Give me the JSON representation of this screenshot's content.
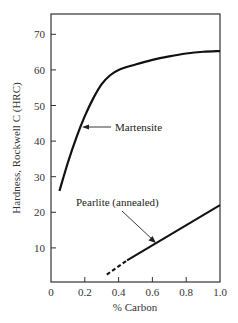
{
  "chart_data": {
    "type": "line",
    "title": "",
    "xlabel": "% Carbon",
    "ylabel": "Hardness, Rockwell C (HRC)",
    "xlim": [
      0,
      1.0
    ],
    "ylim": [
      0,
      75
    ],
    "xticks": [
      "0",
      "0.2",
      "0.4",
      "0.6",
      "0.8",
      "1.0"
    ],
    "yticks": [
      "10",
      "20",
      "30",
      "40",
      "50",
      "60",
      "70"
    ],
    "grid": false,
    "legend": null,
    "series": [
      {
        "name": "Martensite",
        "style": "solid",
        "x": [
          0.05,
          0.1,
          0.15,
          0.2,
          0.25,
          0.3,
          0.35,
          0.4,
          0.5,
          0.6,
          0.7,
          0.8,
          0.9,
          1.0
        ],
        "y": [
          26,
          34,
          41,
          47,
          52,
          56,
          58.5,
          60,
          61.5,
          62.8,
          63.8,
          64.6,
          65.1,
          65.3
        ]
      },
      {
        "name": "Pearlite (annealed)",
        "style": "dashed then solid",
        "x": [
          0.33,
          0.45,
          1.0
        ],
        "y": [
          2.5,
          6.5,
          22
        ],
        "dashed_until_x": 0.45
      }
    ],
    "annotations": [
      {
        "text": "Martensite",
        "arrow_to": [
          0.19,
          44
        ]
      },
      {
        "text": "Pearlite (annealed)",
        "arrow_to": [
          0.61,
          12
        ]
      }
    ]
  }
}
